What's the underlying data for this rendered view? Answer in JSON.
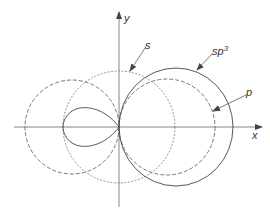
{
  "figure": {
    "axes": {
      "x_label": "x",
      "y_label": "y"
    },
    "labels": {
      "s": "s",
      "sp3_base": "sp",
      "sp3_sup": "3",
      "p": "p"
    },
    "curves": [
      {
        "name": "s-orbital",
        "style": "dashed-light"
      },
      {
        "name": "p-orbital",
        "style": "dashed"
      },
      {
        "name": "sp3-hybrid",
        "style": "solid"
      }
    ],
    "colors": {
      "line": "#555555",
      "text": "#333333"
    }
  }
}
